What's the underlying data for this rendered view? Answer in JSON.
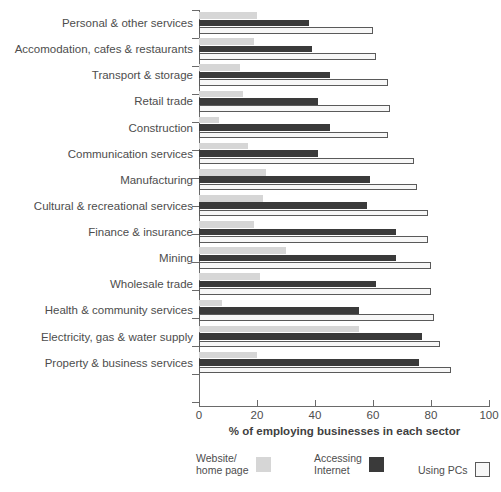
{
  "chart_data": {
    "type": "bar",
    "orientation": "horizontal",
    "title": "",
    "xlabel": "% of employing businesses in each sector",
    "ylabel": "",
    "xlim": [
      0,
      100
    ],
    "xticks": [
      0,
      20,
      40,
      60,
      80,
      100
    ],
    "xtick_labels": [
      "0",
      "20",
      "40",
      "60",
      "80",
      "100"
    ],
    "grid": false,
    "legend_position": "bottom",
    "categories": [
      "Personal & other services",
      "Accomodation, cafes & restaurants",
      "Transport & storage",
      "Retail trade",
      "Construction",
      "Communication services",
      "Manufacturing",
      "Cultural & recreational services",
      "Finance & insurance",
      "Mining",
      "Wholesale trade",
      "Health & community services",
      "Electricity, gas & water supply",
      "Property & business services"
    ],
    "series": [
      {
        "name": "Website/\nhome page",
        "color": "#d6d6d6",
        "values": [
          20,
          19,
          14,
          15,
          7,
          17,
          23,
          22,
          19,
          30,
          21,
          8,
          55,
          20
        ]
      },
      {
        "name": "Accessing\nInternet",
        "color": "#3a3a3a",
        "values": [
          38,
          39,
          45,
          41,
          45,
          41,
          59,
          58,
          68,
          68,
          61,
          55,
          77,
          76
        ]
      },
      {
        "name": "Using PCs",
        "color": "#f7f7f7",
        "values": [
          60,
          61,
          65,
          66,
          65,
          74,
          75,
          79,
          79,
          80,
          80,
          81,
          83,
          87
        ]
      }
    ]
  },
  "legend": {
    "items": [
      {
        "label": "Website/\nhome page",
        "swatch": "light-gray-swatch"
      },
      {
        "label": "Accessing\nInternet",
        "swatch": "dark-swatch"
      },
      {
        "label": "Using PCs",
        "swatch": "white-swatch"
      }
    ]
  },
  "colors": {
    "website": "#d6d6d6",
    "internet": "#3a3a3a",
    "pcs": "#f7f7f7",
    "axis": "#6a6a6a",
    "text": "#4d4d4d"
  }
}
